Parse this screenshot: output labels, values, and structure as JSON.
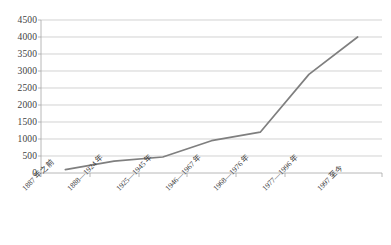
{
  "chart_data": {
    "type": "line",
    "title": "",
    "subtitle": "",
    "xlabel": "",
    "ylabel": "",
    "categories": [
      "1887 年之前",
      "1888—1924 年",
      "1925—1945 年",
      "1946—1967 年",
      "1968—1976 年",
      "1977—1996 年",
      "1997 至今"
    ],
    "values": [
      100,
      350,
      470,
      950,
      1200,
      2900,
      4000
    ],
    "series": [
      {
        "name": "数量",
        "values": [
          100,
          350,
          470,
          950,
          1200,
          2900,
          4000
        ]
      }
    ],
    "ylim": [
      0,
      4500
    ],
    "ytick_labels": [
      "0",
      "500",
      "1000",
      "1500",
      "2000",
      "2500",
      "3000",
      "3500",
      "4000",
      "4500"
    ],
    "ytick_values": [
      0,
      500,
      1000,
      1500,
      2000,
      2500,
      3000,
      3500,
      4000,
      4500
    ],
    "ytick_step": 500,
    "grid": {
      "horizontal": true,
      "vertical": false,
      "color": "#bfbfbf"
    },
    "legend": {
      "visible": false,
      "position": "none",
      "entries": []
    },
    "markers": false,
    "annotations": [],
    "colors": {
      "line": "#7f7f7f",
      "axis": "#a6a6a6",
      "grid": "#bfbfbf",
      "text": "#3f3f3f",
      "background": "#ffffff"
    }
  }
}
